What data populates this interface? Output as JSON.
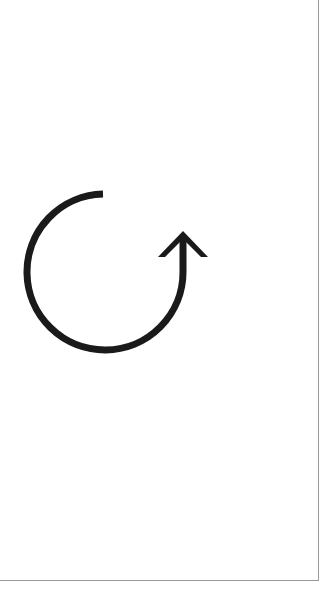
{
  "canvas": {
    "icon": "rotate-clockwise-icon",
    "icon_label": "Rotate",
    "stroke_color": "#1a1a1a",
    "background": "#ffffff",
    "border_color": "#9a9a9a"
  }
}
